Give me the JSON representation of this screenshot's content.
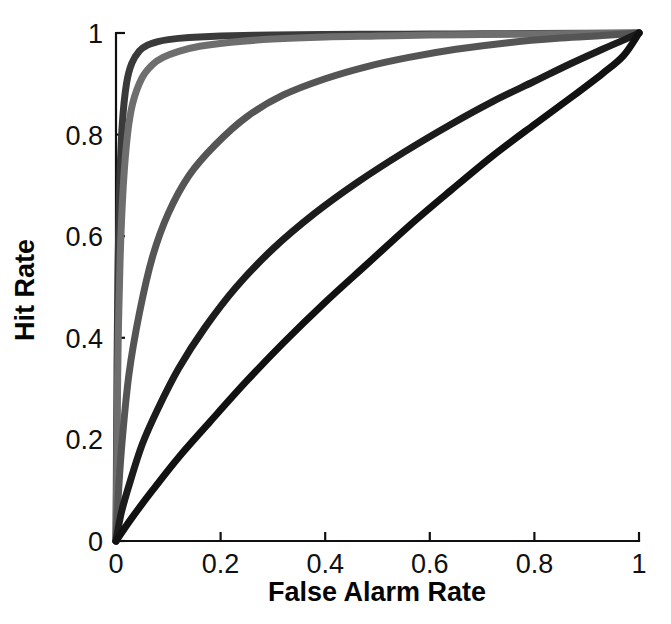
{
  "figure": {
    "background": "#ffffff",
    "ink_color": "#101010"
  },
  "axes": {
    "x_title": "False Alarm Rate",
    "y_title": "Hit Rate",
    "x_ticks": [
      "0",
      "0.2",
      "0.4",
      "0.6",
      "0.8",
      "1"
    ],
    "y_ticks": [
      "0",
      "0.2",
      "0.4",
      "0.6",
      "0.8",
      "1"
    ]
  },
  "chart_data": {
    "type": "line",
    "title": "",
    "subtitle": "",
    "xlabel": "False Alarm Rate",
    "ylabel": "Hit Rate",
    "xlim": [
      0,
      1
    ],
    "ylim": [
      0,
      1
    ],
    "xticks": [
      0,
      0.2,
      0.4,
      0.6,
      0.8,
      1
    ],
    "yticks": [
      0,
      0.2,
      0.4,
      0.6,
      0.8,
      1
    ],
    "grid": false,
    "legend": "none",
    "annotations": [],
    "series": [
      {
        "name": "curve-1",
        "color": "#3a3a3a",
        "linewidth": 7,
        "auc_estimate": 0.99,
        "x": [
          0,
          0.002,
          0.004,
          0.007,
          0.012,
          0.02,
          0.03,
          0.045,
          0.06,
          0.08,
          0.1,
          0.14,
          0.2,
          0.3,
          0.4,
          0.5,
          0.6,
          0.7,
          0.8,
          0.9,
          1
        ],
        "y": [
          0,
          0.35,
          0.55,
          0.7,
          0.82,
          0.9,
          0.94,
          0.965,
          0.976,
          0.983,
          0.987,
          0.991,
          0.994,
          0.996,
          0.997,
          0.9975,
          0.998,
          0.9985,
          0.999,
          0.9995,
          1
        ]
      },
      {
        "name": "curve-2",
        "color": "#6e6e6e",
        "linewidth": 7,
        "auc_estimate": 0.977,
        "x": [
          0,
          0.002,
          0.004,
          0.008,
          0.014,
          0.022,
          0.032,
          0.05,
          0.07,
          0.09,
          0.12,
          0.16,
          0.22,
          0.3,
          0.4,
          0.5,
          0.6,
          0.7,
          0.8,
          0.9,
          1
        ],
        "y": [
          0,
          0.2,
          0.38,
          0.56,
          0.7,
          0.8,
          0.862,
          0.912,
          0.938,
          0.952,
          0.964,
          0.974,
          0.982,
          0.988,
          0.992,
          0.994,
          0.996,
          0.997,
          0.998,
          0.999,
          1
        ]
      },
      {
        "name": "curve-3",
        "color": "#555555",
        "linewidth": 7,
        "auc_estimate": 0.895,
        "x": [
          0,
          0.005,
          0.012,
          0.025,
          0.045,
          0.07,
          0.1,
          0.14,
          0.19,
          0.25,
          0.32,
          0.4,
          0.48,
          0.56,
          0.65,
          0.75,
          0.85,
          0.93,
          1
        ],
        "y": [
          0,
          0.1,
          0.2,
          0.33,
          0.45,
          0.56,
          0.645,
          0.72,
          0.78,
          0.835,
          0.878,
          0.91,
          0.934,
          0.952,
          0.968,
          0.981,
          0.99,
          0.995,
          1
        ]
      },
      {
        "name": "curve-4",
        "color": "#1c1c1c",
        "linewidth": 7,
        "auc_estimate": 0.79,
        "x": [
          0,
          0.01,
          0.025,
          0.05,
          0.08,
          0.12,
          0.17,
          0.23,
          0.3,
          0.38,
          0.46,
          0.55,
          0.64,
          0.72,
          0.8,
          0.87,
          0.93,
          0.97,
          1
        ],
        "y": [
          0,
          0.055,
          0.11,
          0.19,
          0.26,
          0.34,
          0.42,
          0.5,
          0.575,
          0.645,
          0.705,
          0.765,
          0.82,
          0.865,
          0.905,
          0.94,
          0.968,
          0.986,
          1
        ]
      },
      {
        "name": "curve-5",
        "color": "#111111",
        "linewidth": 7,
        "auc_estimate": 0.665,
        "x": [
          0,
          0.03,
          0.07,
          0.12,
          0.18,
          0.25,
          0.32,
          0.4,
          0.48,
          0.56,
          0.64,
          0.72,
          0.8,
          0.87,
          0.93,
          0.97,
          1
        ],
        "y": [
          0,
          0.045,
          0.1,
          0.165,
          0.235,
          0.315,
          0.39,
          0.47,
          0.545,
          0.62,
          0.69,
          0.758,
          0.82,
          0.873,
          0.92,
          0.955,
          1
        ]
      }
    ]
  }
}
